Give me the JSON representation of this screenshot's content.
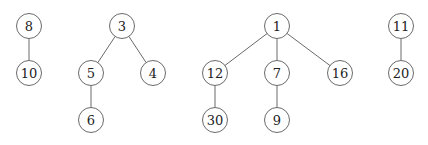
{
  "diagram": {
    "type": "forest",
    "node_radius": 12.5,
    "colors": {
      "stroke": "#6a6a6a",
      "text": "#222222",
      "background": "#ffffff"
    },
    "nodes": [
      {
        "id": "n8",
        "label": "8",
        "x": 29,
        "y": 26
      },
      {
        "id": "n10",
        "label": "10",
        "x": 29,
        "y": 73
      },
      {
        "id": "n3",
        "label": "3",
        "x": 122,
        "y": 26
      },
      {
        "id": "n5",
        "label": "5",
        "x": 91,
        "y": 73
      },
      {
        "id": "n4",
        "label": "4",
        "x": 153,
        "y": 73
      },
      {
        "id": "n6",
        "label": "6",
        "x": 91,
        "y": 120
      },
      {
        "id": "n1",
        "label": "1",
        "x": 277,
        "y": 26
      },
      {
        "id": "n12",
        "label": "12",
        "x": 215,
        "y": 73
      },
      {
        "id": "n7",
        "label": "7",
        "x": 277,
        "y": 73
      },
      {
        "id": "n16",
        "label": "16",
        "x": 340,
        "y": 73
      },
      {
        "id": "n30",
        "label": "30",
        "x": 215,
        "y": 120
      },
      {
        "id": "n9",
        "label": "9",
        "x": 277,
        "y": 120
      },
      {
        "id": "n11",
        "label": "11",
        "x": 401,
        "y": 26
      },
      {
        "id": "n20",
        "label": "20",
        "x": 401,
        "y": 73
      }
    ],
    "edges": [
      [
        "n8",
        "n10"
      ],
      [
        "n3",
        "n5"
      ],
      [
        "n3",
        "n4"
      ],
      [
        "n5",
        "n6"
      ],
      [
        "n1",
        "n12"
      ],
      [
        "n1",
        "n7"
      ],
      [
        "n1",
        "n16"
      ],
      [
        "n12",
        "n30"
      ],
      [
        "n7",
        "n9"
      ],
      [
        "n11",
        "n20"
      ]
    ],
    "trees": [
      {
        "root": "8",
        "nodes": [
          "8",
          "10"
        ]
      },
      {
        "root": "3",
        "nodes": [
          "3",
          "5",
          "4",
          "6"
        ]
      },
      {
        "root": "1",
        "nodes": [
          "1",
          "12",
          "7",
          "16",
          "30",
          "9"
        ]
      },
      {
        "root": "11",
        "nodes": [
          "11",
          "20"
        ]
      }
    ]
  }
}
